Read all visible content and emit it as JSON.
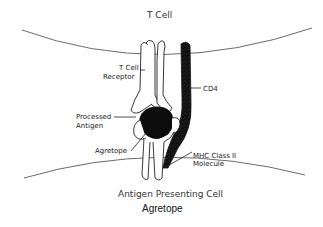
{
  "diagram": {
    "top_cell_label": "T Cell",
    "bottom_cell_label": "Antigen Presenting Cell",
    "caption": "Agretope",
    "labels": {
      "tcr_line1": "T Cell",
      "tcr_line2": "Receptor",
      "cd4": "CD4",
      "antigen_line1": "Processed",
      "antigen_line2": "Antigen",
      "agretope": "Agretope",
      "mhc_line1": "MHC Class II",
      "mhc_line2": "Molecule"
    },
    "colors": {
      "stroke": "#222222",
      "fill_dark": "#111111",
      "background": "#ffffff"
    }
  }
}
